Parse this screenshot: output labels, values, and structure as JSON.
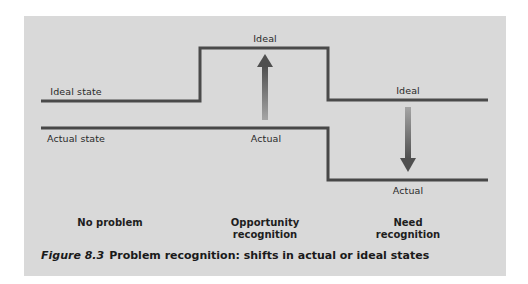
{
  "figure": {
    "number_label": "Figure 8.3",
    "title": "Problem recognition: shifts in actual or ideal states"
  },
  "lines": {
    "ideal_state_label": "Ideal state",
    "actual_state_label": "Actual state"
  },
  "markers": {
    "opportunity_ideal": "Ideal",
    "opportunity_actual": "Actual",
    "need_ideal": "Ideal",
    "need_actual": "Actual"
  },
  "phases": [
    {
      "line1": "No problem",
      "line2": ""
    },
    {
      "line1": "Opportunity",
      "line2": "recognition"
    },
    {
      "line1": "Need",
      "line2": "recognition"
    }
  ],
  "colors": {
    "panel_background": "#d9d9d9",
    "line_color": "#4a4a4a",
    "arrow_dark": "#555555",
    "arrow_light": "#9a9a9a"
  },
  "arrows": {
    "opportunity": "up",
    "need": "down"
  }
}
